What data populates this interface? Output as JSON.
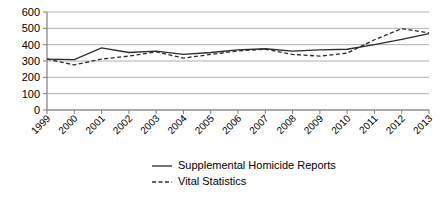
{
  "chart_data": {
    "type": "line",
    "title": "",
    "xlabel": "",
    "ylabel": "",
    "ylim": [
      0,
      600
    ],
    "ytick_values": [
      0,
      100,
      200,
      300,
      400,
      500,
      600
    ],
    "ytick_labels": [
      "0",
      "100",
      "200",
      "300",
      "400",
      "500",
      "600"
    ],
    "grid": true,
    "legend_position": "bottom-center",
    "categories": [
      "1999",
      "2000",
      "2001",
      "2002",
      "2003",
      "2004",
      "2005",
      "2006",
      "2007",
      "2008",
      "2009",
      "2010",
      "2011",
      "2012",
      "2013"
    ],
    "series": [
      {
        "name": "Supplemental Homicide Reports",
        "style": "solid",
        "color": "#2b2b2b",
        "values": [
          312,
          308,
          380,
          352,
          360,
          340,
          352,
          368,
          375,
          360,
          368,
          372,
          400,
          432,
          468
        ]
      },
      {
        "name": "Vital Statistics",
        "style": "dashed",
        "color": "#2b2b2b",
        "values": [
          312,
          276,
          312,
          330,
          356,
          318,
          340,
          362,
          372,
          340,
          330,
          348,
          430,
          498,
          472
        ]
      }
    ]
  },
  "legend": {
    "items": [
      {
        "label": "Supplemental Homicide Reports",
        "style": "solid"
      },
      {
        "label": "Vital Statistics",
        "style": "dashed"
      }
    ]
  }
}
